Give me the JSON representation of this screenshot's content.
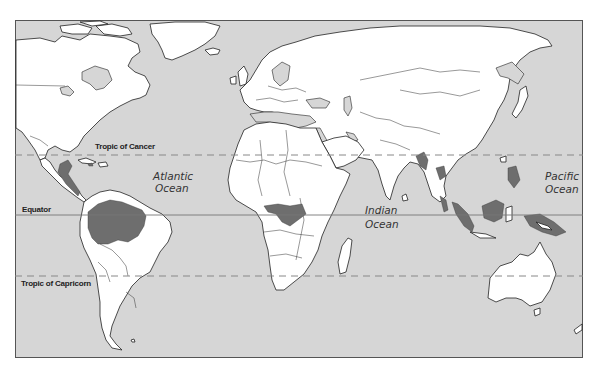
{
  "map": {
    "type": "world-map",
    "projection": "equirectangular-like",
    "colors": {
      "ocean": "#d6d6d6",
      "land": "#ffffff",
      "highlighted_region": "#6e6e6e",
      "outline": "#222222"
    },
    "reference_lines": [
      {
        "name": "Tropic of Cancer",
        "style": "dashed"
      },
      {
        "name": "Equator",
        "style": "solid"
      },
      {
        "name": "Tropic of Capricorn",
        "style": "dashed"
      }
    ],
    "ocean_labels": [
      {
        "line1": "Atlantic",
        "line2": "Ocean"
      },
      {
        "line1": "Indian",
        "line2": "Ocean"
      },
      {
        "line1": "Pacific",
        "line2": "Ocean"
      }
    ],
    "highlighted_regions": [
      "Central America",
      "Amazon Basin",
      "Congo Basin",
      "Southeast Asia",
      "Indonesia",
      "New Guinea"
    ]
  }
}
